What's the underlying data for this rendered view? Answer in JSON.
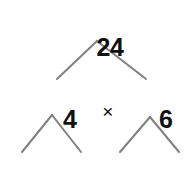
{
  "diagram": {
    "type": "factor-tree",
    "background_color": "#ffffff",
    "text_color": "#111111",
    "branch_color": "#808080",
    "branch_width_px": 2
  },
  "nodes": {
    "root": {
      "label": "24",
      "value": 24,
      "level": 1,
      "x": 97,
      "y": 22
    },
    "level2": {
      "left": {
        "label": "4",
        "value": 4,
        "x": 56,
        "y": 94
      },
      "operator": {
        "label": "×",
        "name": "multiplication-sign",
        "x": 99,
        "y": 94
      },
      "right": {
        "label": "6",
        "value": 6,
        "x": 152,
        "y": 94
      }
    },
    "level3": {
      "factors": [
        "2",
        "2",
        "2",
        "3"
      ],
      "operators": [
        "×",
        "×",
        "×"
      ],
      "expression": "2 × 2 × 2 × 3",
      "y": 171
    }
  },
  "branches": [
    {
      "name": "root-to-4",
      "apex": [
        97,
        41
      ],
      "end": [
        57,
        79
      ]
    },
    {
      "name": "root-to-6",
      "apex": [
        97,
        41
      ],
      "end": [
        146,
        79
      ]
    },
    {
      "name": "four-to-first-2",
      "apex": [
        52,
        115
      ],
      "end": [
        22,
        152
      ]
    },
    {
      "name": "four-to-second-2",
      "apex": [
        52,
        115
      ],
      "end": [
        81,
        152
      ]
    },
    {
      "name": "six-to-third-2",
      "apex": [
        150,
        117
      ],
      "end": [
        120,
        152
      ]
    },
    {
      "name": "six-to-three",
      "apex": [
        150,
        117
      ],
      "end": [
        179,
        152
      ]
    }
  ],
  "chart_data": {
    "type": "diagram",
    "levels": [
      {
        "level": 1,
        "items": [
          "24"
        ]
      },
      {
        "level": 2,
        "items": [
          "4",
          "6"
        ],
        "relation": "4 × 6 = 24"
      },
      {
        "level": 3,
        "items": [
          "2",
          "2",
          "2",
          "3"
        ],
        "relation": "2 × 2 × 2 × 3 = 24"
      }
    ],
    "prime_factorization": "2 × 2 × 2 × 3"
  }
}
